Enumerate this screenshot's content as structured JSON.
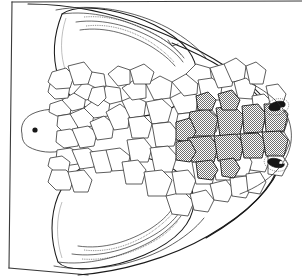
{
  "figure": {
    "domain_kind": "scientific-line-illustration",
    "view": "dorsal view of reptile head",
    "background_color": "#ffffff",
    "ink_color": "#1a1a1a",
    "shaded_scale_color": "#9a9a9a",
    "caption": "",
    "title": "",
    "orientation": "snout to left, occiput to right",
    "has_text_labels": false,
    "has_scale_bar": false
  },
  "frame": {
    "name": "page-edge-border",
    "description": "slanted page border line along left margin",
    "visible": true
  },
  "anatomy": {
    "snout": {
      "label": "rostral snout tip",
      "position": "far left"
    },
    "nostril": {
      "label": "nostril",
      "count": 1,
      "color": "#171717"
    },
    "eyes": [
      {
        "label": "orbit-upper-right",
        "color": "#141414",
        "highlight": "#ffffff"
      },
      {
        "label": "orbit-lower-right",
        "color": "#141414",
        "highlight": "#ffffff"
      }
    ],
    "jaws": [
      {
        "label": "upper-jaw-margin-dentition",
        "teeth_row_count": 2,
        "position": "top"
      },
      {
        "label": "lower-jaw-margin-dentition",
        "teeth_row_count": 2,
        "position": "bottom"
      }
    ],
    "head_outline": {
      "label": "head-silhouette",
      "shape": "broad rounded triangular"
    },
    "cheek_panels": [
      {
        "label": "upper-cheek-panel",
        "fill": "#ffffff"
      },
      {
        "label": "lower-cheek-panel",
        "fill": "#ffffff"
      }
    ]
  },
  "scalation": {
    "label": "cephalic scale mosaic",
    "total_plain_scales": 62,
    "total_shaded_scales": 14,
    "shaded_group_label": "shaded occipital / nuchal scale field",
    "shaded_rows": 2,
    "notes": "polygonal plates arranged symmetrically about the midline"
  }
}
